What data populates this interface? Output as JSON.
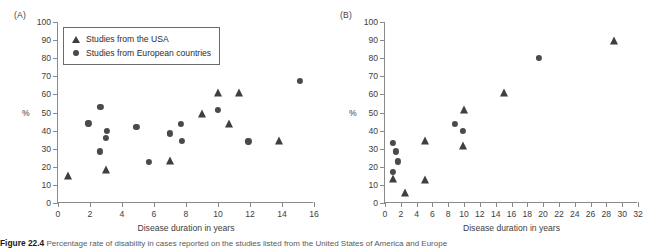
{
  "figure": {
    "caption_number": "Figure 22.4",
    "caption_text": "Percentage rate of disability in cases reported on the studies listed from the United States of America and Europe"
  },
  "panels": [
    {
      "label": "(A)",
      "legend": {
        "items": [
          {
            "marker": "triangle-marker",
            "label": "Studies from the USA"
          },
          {
            "marker": "circle-marker",
            "label": "Studies from European countries"
          }
        ]
      }
    },
    {
      "label": "(B)",
      "legend": null
    }
  ],
  "chart_data": [
    {
      "type": "scatter",
      "title": "(A)",
      "xlabel": "Disease duration in years",
      "ylabel": "%",
      "xlim": [
        0,
        16
      ],
      "ylim": [
        0,
        100
      ],
      "xticks": [
        0,
        2,
        4,
        6,
        8,
        10,
        12,
        14,
        16
      ],
      "yticks": [
        0,
        10,
        20,
        30,
        40,
        50,
        60,
        70,
        80,
        90,
        100
      ],
      "grid": false,
      "legend_position": "upper-left",
      "series": [
        {
          "name": "Studies from the USA",
          "marker": "triangle",
          "color": "#3f3f3f",
          "points": [
            {
              "x": 0.6,
              "y": 15
            },
            {
              "x": 3.0,
              "y": 18.5
            },
            {
              "x": 7.0,
              "y": 23
            },
            {
              "x": 9.0,
              "y": 49
            },
            {
              "x": 10.0,
              "y": 61
            },
            {
              "x": 10.7,
              "y": 43.5
            },
            {
              "x": 11.3,
              "y": 60.5
            },
            {
              "x": 13.8,
              "y": 34
            }
          ]
        },
        {
          "name": "Studies from European countries",
          "marker": "circle",
          "color": "#4a4a4a",
          "points": [
            {
              "x": 1.9,
              "y": 44
            },
            {
              "x": 2.6,
              "y": 28.5
            },
            {
              "x": 2.65,
              "y": 53
            },
            {
              "x": 3.0,
              "y": 36
            },
            {
              "x": 3.05,
              "y": 40
            },
            {
              "x": 4.9,
              "y": 42
            },
            {
              "x": 5.7,
              "y": 22.5
            },
            {
              "x": 7.0,
              "y": 38.5
            },
            {
              "x": 7.7,
              "y": 43.5
            },
            {
              "x": 7.75,
              "y": 34.5
            },
            {
              "x": 10.0,
              "y": 51.5
            },
            {
              "x": 11.9,
              "y": 34
            },
            {
              "x": 15.1,
              "y": 67.5
            }
          ]
        }
      ]
    },
    {
      "type": "scatter",
      "title": "(B)",
      "xlabel": "Disease duration in years",
      "ylabel": "%",
      "xlim": [
        0,
        32
      ],
      "ylim": [
        0,
        100
      ],
      "xticks": [
        0,
        2,
        4,
        6,
        8,
        10,
        12,
        14,
        16,
        18,
        20,
        22,
        24,
        26,
        28,
        30,
        32
      ],
      "yticks": [
        0,
        10,
        20,
        30,
        40,
        50,
        60,
        70,
        80,
        90,
        100
      ],
      "grid": false,
      "legend_position": "none",
      "series": [
        {
          "name": "Studies from the USA",
          "marker": "triangle",
          "color": "#3f3f3f",
          "points": [
            {
              "x": 1.0,
              "y": 13
            },
            {
              "x": 2.5,
              "y": 5.5
            },
            {
              "x": 5.0,
              "y": 12.5
            },
            {
              "x": 5.1,
              "y": 34
            },
            {
              "x": 9.9,
              "y": 31.5
            },
            {
              "x": 10.0,
              "y": 51.5
            },
            {
              "x": 15.0,
              "y": 60.5
            },
            {
              "x": 29.0,
              "y": 89.5
            }
          ]
        },
        {
          "name": "Studies from European countries",
          "marker": "circle",
          "color": "#4a4a4a",
          "points": [
            {
              "x": 1.0,
              "y": 33
            },
            {
              "x": 1.0,
              "y": 17
            },
            {
              "x": 1.4,
              "y": 28.5
            },
            {
              "x": 1.6,
              "y": 23
            },
            {
              "x": 8.8,
              "y": 43.5
            },
            {
              "x": 9.9,
              "y": 40
            },
            {
              "x": 19.5,
              "y": 80
            }
          ]
        }
      ]
    }
  ]
}
